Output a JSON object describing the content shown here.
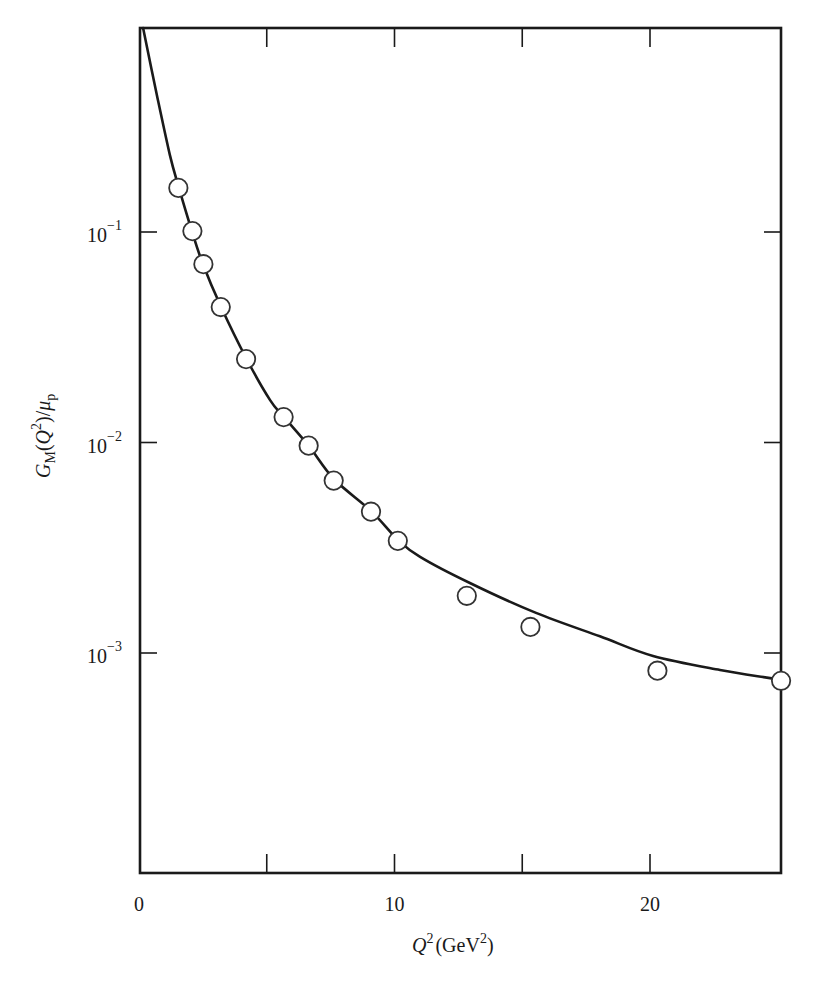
{
  "chart_data": {
    "type": "scatter",
    "title": "",
    "xlabel": "Q^2 (GeV^2)",
    "ylabel": "G_M(Q^2)/μ_p",
    "xlabel_parts": {
      "var": "Q",
      "var_sup": "2",
      "unit_open": "(GeV",
      "unit_sup": "2",
      "unit_close": ")"
    },
    "ylabel_parts": {
      "g": "G",
      "g_sub": "M",
      "open": "(",
      "q": "Q",
      "q_sup": "2",
      "close": ")/",
      "mu": "μ",
      "mu_sub": "p"
    },
    "xlim": [
      0,
      25.1
    ],
    "ylim": [
      9e-05,
      0.93
    ],
    "yscale": "log",
    "grid": false,
    "legend": null,
    "x_ticks": [
      {
        "value": 0,
        "label": "0"
      },
      {
        "value": 5,
        "label": ""
      },
      {
        "value": 10,
        "label": "10"
      },
      {
        "value": 15,
        "label": ""
      },
      {
        "value": 20,
        "label": "20"
      }
    ],
    "y_ticks": [
      {
        "value": 0.1,
        "base": "10",
        "exp": "−1"
      },
      {
        "value": 0.01,
        "base": "10",
        "exp": "−2"
      },
      {
        "value": 0.001,
        "base": "10",
        "exp": "−3"
      }
    ],
    "series": [
      {
        "name": "data",
        "style": "open-circle",
        "x": [
          1.54,
          2.09,
          2.52,
          3.2,
          4.19,
          5.66,
          6.64,
          7.62,
          9.08,
          10.13,
          12.83,
          15.32,
          20.29,
          25.13
        ],
        "y": [
          0.162,
          0.101,
          0.0703,
          0.044,
          0.0249,
          0.0132,
          0.00966,
          0.00659,
          0.00469,
          0.00341,
          0.00187,
          0.00133,
          0.000824,
          0.000738
        ]
      },
      {
        "name": "fit",
        "style": "solid-line",
        "x": [
          0.16,
          0.74,
          1.21,
          1.53,
          2.07,
          2.5,
          3.21,
          4.19,
          5.13,
          5.68,
          6.65,
          7.63,
          9.08,
          10.14,
          11.0,
          12.95,
          15.54,
          18.04,
          20.12,
          22.74,
          24.7,
          25.13
        ],
        "y": [
          0.931,
          0.424,
          0.232,
          0.167,
          0.101,
          0.0705,
          0.0441,
          0.0252,
          0.0159,
          0.0132,
          0.00962,
          0.00671,
          0.00473,
          0.00344,
          0.00286,
          0.00215,
          0.00155,
          0.0012,
          0.000968,
          0.00083,
          0.00076,
          0.000744
        ]
      }
    ]
  }
}
